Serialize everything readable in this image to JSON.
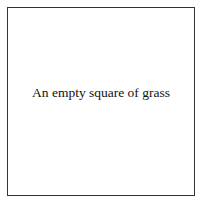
{
  "tile": {
    "caption": "An empty square of grass",
    "border_color": "#333333",
    "background_color": "#ffffff"
  }
}
